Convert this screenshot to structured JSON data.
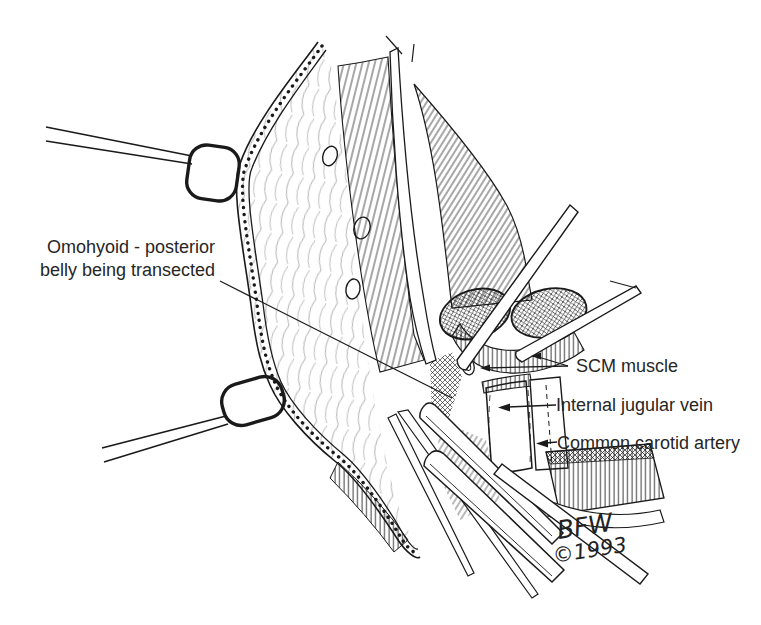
{
  "colors": {
    "ink": "#1a1a1a",
    "paper": "#ffffff",
    "label": "#262626"
  },
  "labels": {
    "omohyoid": {
      "line1": "Omohyoid - posterior",
      "line2": "belly being transected"
    },
    "scm": "SCM muscle",
    "ijv": "Internal jugular vein",
    "carotid": "Common carotid artery"
  },
  "signature": {
    "initials": "BFW",
    "year": "©1993"
  }
}
